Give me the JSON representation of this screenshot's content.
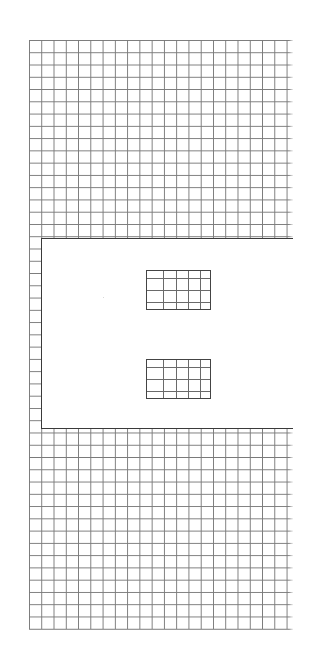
{
  "canvas": {
    "background": "#ffffff",
    "grid": {
      "line_color": "#7a7a7a",
      "cell_size_px": 12.27,
      "origin": [
        29,
        40
      ],
      "extent": [
        293,
        629
      ]
    }
  },
  "panel": {
    "border_color": "#3a3a3a",
    "fill": "#ffffff"
  },
  "minigrids": [
    {
      "label": "upper-grid-window"
    },
    {
      "label": "lower-grid-window"
    }
  ]
}
